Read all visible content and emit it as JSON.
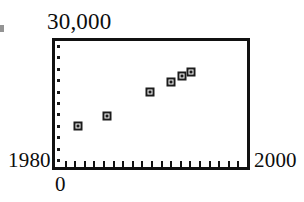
{
  "figure": {
    "background_color": "#ffffff",
    "ink_color": "#111111"
  },
  "labels": {
    "y_max": "30,000",
    "y_zero": "0",
    "x_min": "1980",
    "x_max": "2000"
  },
  "marks": {
    "margin_speck": ""
  },
  "chart_data": {
    "type": "scatter",
    "title": "",
    "xlabel": "",
    "ylabel": "",
    "xlim": [
      1980,
      2000
    ],
    "ylim": [
      0,
      30000
    ],
    "x_tick_labels": [
      "1980",
      "2000"
    ],
    "y_tick_labels": [
      "0",
      "30,000"
    ],
    "grid": false,
    "legend": null,
    "x_tick_count": 20,
    "y_tick_count": 11,
    "marker_style": "open-square",
    "series": [
      {
        "name": "series-1",
        "points": [
          {
            "x": 1982.4,
            "y": 9800
          },
          {
            "x": 1985.4,
            "y": 12050
          },
          {
            "x": 1989.9,
            "y": 17950
          },
          {
            "x": 1992.1,
            "y": 20250
          },
          {
            "x": 1993.2,
            "y": 21600
          },
          {
            "x": 1994.2,
            "y": 22700
          }
        ]
      }
    ]
  }
}
